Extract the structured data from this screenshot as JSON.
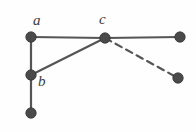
{
  "figure": {
    "width": 196,
    "height": 132,
    "background_color": "#fefefe"
  },
  "style": {
    "node_fill": "#4a4a4a",
    "node_stroke": "#343434",
    "node_radius": 5.2,
    "solid_edge_color": "#555555",
    "dashed_edge_color": "#555555",
    "edge_width": 2.2,
    "dash_pattern": "7,5",
    "label_color": "#3c3c3c"
  },
  "nodes": [
    {
      "id": "a",
      "label": "a",
      "x": 31,
      "y": 37,
      "labeled": true
    },
    {
      "id": "b",
      "label": "b",
      "x": 31,
      "y": 75,
      "labeled": true
    },
    {
      "id": "d",
      "label": "",
      "x": 31,
      "y": 113,
      "labeled": false
    },
    {
      "id": "c",
      "label": "c",
      "x": 105,
      "y": 38,
      "labeled": true
    },
    {
      "id": "e",
      "label": "",
      "x": 180,
      "y": 37,
      "labeled": false
    },
    {
      "id": "f",
      "label": "",
      "x": 178,
      "y": 78,
      "labeled": false
    }
  ],
  "edges": [
    {
      "from": "a",
      "to": "c",
      "style": "solid"
    },
    {
      "from": "a",
      "to": "b",
      "style": "solid"
    },
    {
      "from": "b",
      "to": "c",
      "style": "solid"
    },
    {
      "from": "b",
      "to": "d",
      "style": "solid"
    },
    {
      "from": "c",
      "to": "e",
      "style": "solid"
    },
    {
      "from": "c",
      "to": "f",
      "style": "dashed"
    }
  ],
  "labels": {
    "a": "a",
    "b": "b",
    "c": "c"
  }
}
